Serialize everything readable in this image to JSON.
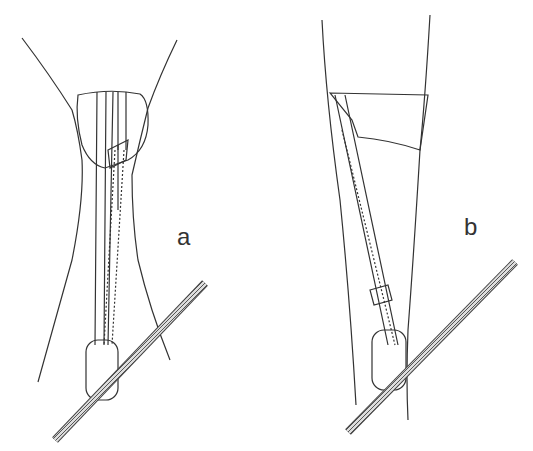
{
  "figure": {
    "panels": [
      {
        "id": "a",
        "label": "a",
        "description": "sling threaded around chockstone in V-shaped crack, carabiner clipped to rope"
      },
      {
        "id": "b",
        "label": "b",
        "description": "sling looped around chockstone in parallel crack, knotted, carabiner clipped to rope"
      }
    ],
    "colors": {
      "line": "#333333",
      "rope": "#666666",
      "background": "#ffffff"
    }
  }
}
